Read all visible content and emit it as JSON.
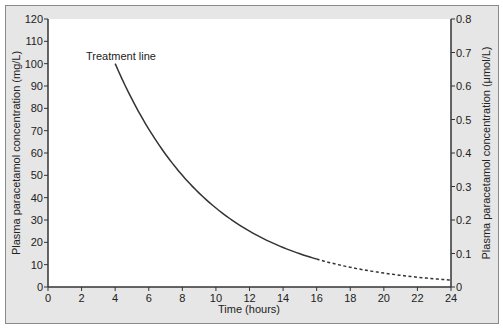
{
  "chart_data": {
    "type": "line",
    "title": "",
    "xlabel": "Time (hours)",
    "ylabel": "Plasma paracetamol concentration (mg/L)",
    "ylabel_right": "Plasma paracetamol concentration (μmol/L)",
    "xlim": [
      0,
      24
    ],
    "ylim": [
      0,
      120
    ],
    "ylim_right": [
      0,
      0.8
    ],
    "x_ticks": [
      0,
      2,
      4,
      6,
      8,
      10,
      12,
      14,
      16,
      18,
      20,
      22,
      24
    ],
    "y_ticks": [
      0,
      10,
      20,
      30,
      40,
      50,
      60,
      70,
      80,
      90,
      100,
      110,
      120
    ],
    "y_ticks_right": [
      "0",
      "0.1",
      "0.2",
      "0.3",
      "0.4",
      "0.5",
      "0.6",
      "0.7",
      "0.8"
    ],
    "grid": false,
    "legend": null,
    "annotations": [
      {
        "text": "Treatment line",
        "x": 4,
        "y": 100
      }
    ],
    "series": [
      {
        "name": "Treatment line",
        "style": "solid",
        "x": [
          4,
          6,
          8,
          10,
          12,
          14,
          16
        ],
        "values": [
          100,
          70.7,
          50,
          35.4,
          25,
          17.7,
          12.5
        ]
      },
      {
        "name": "Treatment line (extrapolated)",
        "style": "dotted",
        "x": [
          16,
          18,
          20,
          22,
          24
        ],
        "values": [
          12.5,
          8.8,
          6.25,
          4.4,
          3.1
        ]
      }
    ]
  }
}
